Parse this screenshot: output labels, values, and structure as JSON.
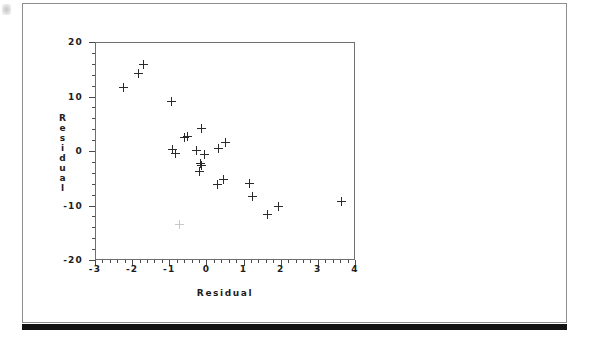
{
  "page": {
    "background_color": "#ffffff",
    "frame_color": "#8e8e8e",
    "band_color": "#131313"
  },
  "figure": {
    "axis_color": "#6f6f6f",
    "marker_color": "#2b2b2b",
    "marker_glyph": "plus"
  },
  "chart_data": {
    "type": "scatter",
    "title": "",
    "xlabel": "Residual",
    "ylabel": "Residual",
    "xlim": [
      -3,
      4
    ],
    "ylim": [
      -20,
      20
    ],
    "xticks": [
      -3,
      -2,
      -1,
      0,
      1,
      2,
      3,
      4
    ],
    "xtick_labels": [
      "-3",
      "-2",
      "-1",
      "0",
      "1",
      "2",
      "3",
      "4"
    ],
    "yticks": [
      -20,
      -10,
      0,
      10,
      20
    ],
    "ytick_labels": [
      "-20",
      "-10",
      "0",
      "10",
      "20"
    ],
    "minor_ticks": true,
    "grid": false,
    "legend": null,
    "series": [
      {
        "name": "residuals",
        "marker": "+",
        "points": [
          [
            -2.22,
            11.6
          ],
          [
            -1.84,
            14.2
          ],
          [
            -1.7,
            15.8
          ],
          [
            -0.93,
            9.1
          ],
          [
            -0.6,
            2.5
          ],
          [
            -0.52,
            2.6
          ],
          [
            -0.12,
            4.1
          ],
          [
            -0.92,
            0.2
          ],
          [
            -0.82,
            -0.4
          ],
          [
            -0.27,
            0.1
          ],
          [
            -0.06,
            -0.6
          ],
          [
            0.33,
            0.5
          ],
          [
            0.52,
            1.6
          ],
          [
            -0.15,
            -2.3
          ],
          [
            -0.14,
            -2.7
          ],
          [
            -0.18,
            -3.8
          ],
          [
            0.3,
            -6.2
          ],
          [
            0.47,
            -5.2
          ],
          [
            1.16,
            -5.9
          ],
          [
            1.23,
            -8.3
          ],
          [
            1.93,
            -10.2
          ],
          [
            1.64,
            -11.6
          ],
          [
            3.63,
            -9.2
          ],
          [
            -0.73,
            -13.4
          ]
        ]
      }
    ]
  }
}
